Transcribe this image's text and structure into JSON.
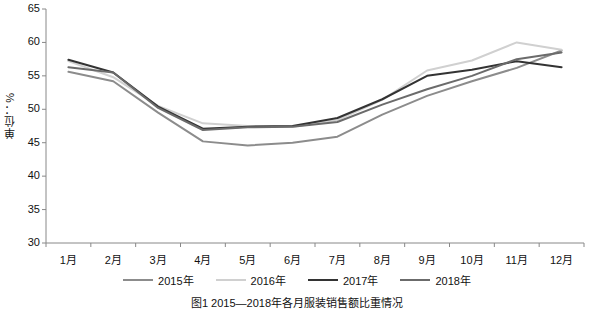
{
  "chart_data": {
    "type": "line",
    "title": "",
    "caption": "图1  2015—2018年各月服装销售额比重情况",
    "xlabel": "",
    "ylabel": "单位：%",
    "categories": [
      "1月",
      "2月",
      "3月",
      "4月",
      "5月",
      "6月",
      "7月",
      "8月",
      "9月",
      "10月",
      "11月",
      "12月"
    ],
    "ylim": [
      30,
      65
    ],
    "yticks": [
      30,
      35,
      40,
      45,
      50,
      55,
      60,
      65
    ],
    "grid": false,
    "legend_position": "bottom",
    "series": [
      {
        "name": "2015年",
        "color": "#8c8c8c",
        "values": [
          55.6,
          54.2,
          49.5,
          45.2,
          44.6,
          45.0,
          45.9,
          49.2,
          52.0,
          54.2,
          56.2,
          58.8
        ]
      },
      {
        "name": "2016年",
        "color": "#d0d0d0",
        "values": [
          57.2,
          54.8,
          50.5,
          47.9,
          47.5,
          47.4,
          48.4,
          51.4,
          55.8,
          57.3,
          60.0,
          58.9
        ]
      },
      {
        "name": "2017年",
        "color": "#333333",
        "values": [
          57.4,
          55.5,
          50.4,
          47.1,
          47.4,
          47.5,
          48.7,
          51.5,
          55.0,
          55.9,
          57.2,
          56.3
        ]
      },
      {
        "name": "2018年",
        "color": "#6b6b6b",
        "values": [
          56.3,
          55.5,
          50.2,
          46.9,
          47.3,
          47.4,
          48.1,
          50.7,
          53.0,
          55.0,
          57.5,
          58.5
        ]
      }
    ]
  }
}
